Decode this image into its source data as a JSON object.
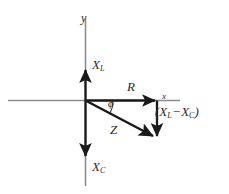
{
  "figure": {
    "background_color": "#ffffff",
    "axis_color": "#8a8a8a",
    "vector_color": "#1a1a1a",
    "text_color": "#2b2b2b"
  },
  "axes": {
    "y_axis_label": "y",
    "x_axis_label": "x",
    "origin": {
      "x": 85,
      "y": 100
    },
    "x_axis_span": {
      "from_x": 8,
      "to_x": 180,
      "y": 100
    },
    "y_axis_span": {
      "from_y": 18,
      "to_y": 186,
      "x": 85
    }
  },
  "vectors": [
    {
      "name": "inductive-reactance",
      "label_text": "X",
      "label_subscript": "L",
      "direction": "up",
      "from": {
        "x": 85,
        "y": 100
      },
      "to": {
        "x": 85,
        "y": 68
      }
    },
    {
      "name": "capacitive-reactance",
      "label_text": "X",
      "label_subscript": "C",
      "direction": "down",
      "from": {
        "x": 85,
        "y": 100
      },
      "to": {
        "x": 85,
        "y": 158
      }
    },
    {
      "name": "resistance",
      "label_text": "R",
      "label_subscript": "",
      "direction": "right",
      "from": {
        "x": 85,
        "y": 100
      },
      "to": {
        "x": 157,
        "y": 100
      }
    },
    {
      "name": "net-reactance",
      "label_text": "(X",
      "label_subscript": "L",
      "direction": "down",
      "from": {
        "x": 157,
        "y": 100
      },
      "to": {
        "x": 157,
        "y": 138
      }
    },
    {
      "name": "impedance",
      "label_text": "Z",
      "label_subscript": "",
      "direction": "diagonal-down-right",
      "from": {
        "x": 85,
        "y": 100
      },
      "to": {
        "x": 157,
        "y": 138
      }
    }
  ],
  "labels": {
    "axis_y": "y",
    "axis_x": "x",
    "inductive_reactance": {
      "base": "X",
      "subscript": "L"
    },
    "capacitive_reactance": {
      "base": "X",
      "subscript": "C"
    },
    "resistance": "R",
    "impedance": "Z",
    "phase_angle": "ϕ",
    "net_reactance": {
      "open_paren": "(",
      "first_base": "X",
      "first_subscript": "L",
      "operator": "−",
      "second_base": "X",
      "second_subscript": "C",
      "close_paren": ")"
    }
  },
  "angle": {
    "name": "phase-angle-phi",
    "symbol": "ϕ",
    "vertex": {
      "x": 85,
      "y": 100
    },
    "between": [
      "resistance",
      "impedance"
    ],
    "arc_radius": 26
  }
}
